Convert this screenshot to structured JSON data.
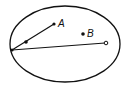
{
  "diagram": {
    "ellipse": {
      "cx": 65,
      "cy": 44,
      "rx": 55,
      "ry": 38,
      "stroke": "#111111"
    },
    "points": {
      "left_edge": {
        "x": 12,
        "y": 50,
        "style": "filled"
      },
      "mid": {
        "x": 26,
        "y": 42,
        "style": "filled"
      },
      "A": {
        "x": 54,
        "y": 24,
        "label": "A",
        "style": "filled"
      },
      "B": {
        "x": 83,
        "y": 34,
        "label": "B",
        "style": "filled"
      },
      "right_end": {
        "x": 106,
        "y": 43,
        "style": "open"
      }
    },
    "segments": [
      {
        "from": "left_edge",
        "to": "A"
      },
      {
        "from": "left_edge",
        "to": "right_end"
      }
    ],
    "labels": {
      "a": "A",
      "b": "B"
    }
  }
}
